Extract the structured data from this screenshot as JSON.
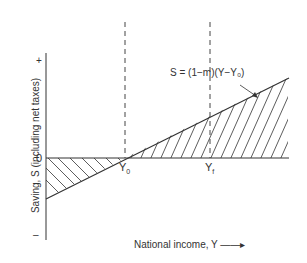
{
  "diagram": {
    "equation": "S = (1−m)(Y−Y₀)",
    "y_axis_label": "Saving, S (including net taxes)",
    "x_axis_label": "National income, Y ——▸",
    "tick_plus": "+",
    "tick_zero": "0",
    "tick_minus": "–",
    "marker_y0": "Y",
    "marker_y0_sub": "0",
    "marker_yf": "Y",
    "marker_yf_sub": "f"
  }
}
